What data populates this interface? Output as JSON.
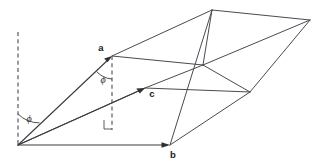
{
  "figure": {
    "background_color": "#ffffff",
    "line_color": "#4a4a52",
    "dash_color": "#5a5a60",
    "label_color": "#1a1a1a",
    "width": 320,
    "height": 163
  },
  "labels": {
    "vector_a": "a",
    "vector_b": "b",
    "vector_c": "c",
    "angle_origin": "ϕ",
    "angle_at_a": "ϕ"
  },
  "geometry": {
    "origin": {
      "x": 18,
      "y": 145
    },
    "vertex_a": {
      "x": 112,
      "y": 56
    },
    "vertex_b": {
      "x": 170,
      "y": 145
    },
    "vertex_c": {
      "x": 145,
      "y": 88
    },
    "vertex_top": {
      "x": 212,
      "y": 10
    },
    "vertex_top_right": {
      "x": 310,
      "y": 20
    },
    "vertex_mid_right": {
      "x": 250,
      "y": 92
    },
    "vertex_a_right": {
      "x": 203,
      "y": 65
    },
    "dashed_left_top": {
      "x": 18,
      "y": 32
    },
    "dashed_a_bottom": {
      "x": 112,
      "y": 130
    },
    "right_angle_marker": {
      "x": 104,
      "y": 120
    }
  },
  "annotations": {
    "right_angle_present": "true",
    "arc_count": "2",
    "arrow_count": "3"
  }
}
